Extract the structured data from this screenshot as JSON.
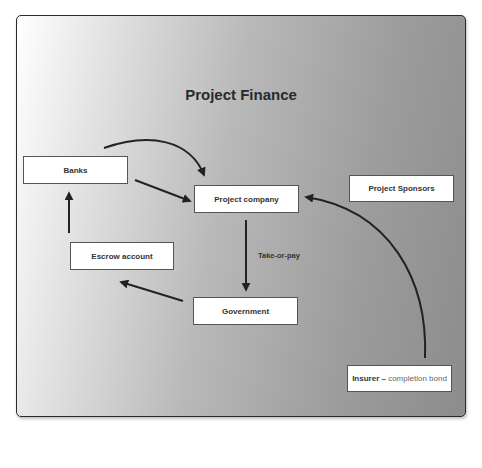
{
  "diagram": {
    "title": "Project Finance",
    "nodes": {
      "banks": {
        "label": "Banks"
      },
      "project_company": {
        "label": "Project company"
      },
      "project_sponsors": {
        "label": "Project Sponsors"
      },
      "escrow_account": {
        "label": "Escrow account"
      },
      "government": {
        "label": "Government"
      },
      "insurer": {
        "label": "Insurer",
        "separator": " – ",
        "detail": "completion bond"
      }
    },
    "edge_labels": {
      "take_or_pay": "Take-or-pay"
    },
    "edges": [
      {
        "from": "banks",
        "to": "project_company",
        "style": "curved"
      },
      {
        "from": "banks",
        "to": "project_company",
        "style": "straight"
      },
      {
        "from": "project_company",
        "to": "government",
        "label": "Take-or-pay"
      },
      {
        "from": "government",
        "to": "escrow_account"
      },
      {
        "from": "escrow_account",
        "to": "banks"
      },
      {
        "from": "insurer",
        "to": "project_company",
        "style": "curved"
      }
    ],
    "colors": {
      "arrow": "#222222",
      "node_fill": "#ffffff",
      "node_border": "#555555"
    }
  }
}
